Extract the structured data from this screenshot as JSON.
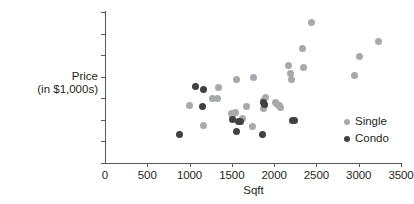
{
  "chart_data": {
    "type": "scatter",
    "title": "",
    "xlabel": "Sqft",
    "ylabel_line1": "Price",
    "ylabel_line2": "(in $1,000s)",
    "xlim": [
      0,
      3500
    ],
    "ylim": [
      0,
      700
    ],
    "xticks": [
      0,
      500,
      1000,
      1500,
      2000,
      2500,
      3000,
      3500
    ],
    "yticks": [
      0,
      100,
      200,
      300,
      400,
      500,
      600,
      700
    ],
    "grid": false,
    "legend_position": "right",
    "colors": {
      "single": "#a7a9ac",
      "condo": "#414042",
      "axis": "#58595b",
      "text": "#231f20",
      "background": "#ffffff"
    },
    "series": [
      {
        "name": "Single",
        "color": "#a7a9ac",
        "points": [
          [
            1000,
            268
          ],
          [
            1160,
            175
          ],
          [
            1270,
            298
          ],
          [
            1330,
            300
          ],
          [
            1345,
            350
          ],
          [
            1490,
            228
          ],
          [
            1510,
            218
          ],
          [
            1545,
            232
          ],
          [
            1560,
            385
          ],
          [
            1620,
            205
          ],
          [
            1670,
            262
          ],
          [
            1745,
            168
          ],
          [
            1760,
            395
          ],
          [
            1870,
            290
          ],
          [
            1880,
            252
          ],
          [
            1885,
            265
          ],
          [
            1895,
            303
          ],
          [
            2015,
            280
          ],
          [
            2035,
            272
          ],
          [
            2060,
            268
          ],
          [
            2080,
            258
          ],
          [
            2175,
            450
          ],
          [
            2190,
            415
          ],
          [
            2200,
            385
          ],
          [
            2330,
            530
          ],
          [
            2350,
            443
          ],
          [
            2440,
            650
          ],
          [
            2950,
            407
          ],
          [
            3010,
            492
          ],
          [
            3235,
            565
          ]
        ]
      },
      {
        "name": "Condo",
        "color": "#414042",
        "points": [
          [
            880,
            130
          ],
          [
            1065,
            353
          ],
          [
            1150,
            260
          ],
          [
            1170,
            340
          ],
          [
            1510,
            203
          ],
          [
            1555,
            148
          ],
          [
            1575,
            193
          ],
          [
            1600,
            192
          ],
          [
            1865,
            130
          ],
          [
            1880,
            282
          ],
          [
            1890,
            272
          ],
          [
            2215,
            198
          ],
          [
            2240,
            199
          ]
        ]
      }
    ]
  },
  "legend": {
    "items": [
      {
        "label": "Single",
        "key": "single"
      },
      {
        "label": "Condo",
        "key": "condo"
      }
    ]
  }
}
